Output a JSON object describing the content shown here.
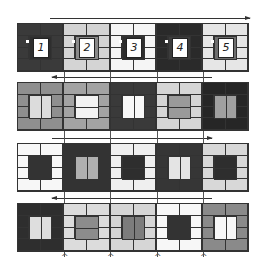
{
  "diagram": {
    "colors": {
      "white": "#ffffff",
      "light": "#d9d9d9",
      "gray": "#9a9a9a",
      "mid": "#7a7a7a",
      "dark": "#3a3a3a",
      "darkest": "#262626",
      "line": "#333333"
    },
    "rows": [
      {
        "direction": "right",
        "tiles": [
          {
            "label": "1",
            "frame": "#3a3a3a",
            "center": "#2e2e2e",
            "split": "none"
          },
          {
            "label": "2",
            "frame": "#d4d4d4",
            "center": "#8a8a8a",
            "split": "none"
          },
          {
            "label": "3",
            "frame": "#f5f5f5",
            "center": "#2e2e2e",
            "split": "none"
          },
          {
            "label": "4",
            "frame": "#2a2a2a",
            "center": "#3c3c3c",
            "split": "none"
          },
          {
            "label": "5",
            "frame": "#e6e6e6",
            "center": "#6e6e6e",
            "split": "none"
          }
        ]
      },
      {
        "direction": "left",
        "tiles": [
          {
            "frame": "#8f8f8f",
            "center": "#dcdcdc",
            "split": "v"
          },
          {
            "frame": "#a3a3a3",
            "center": "#f2f2f2",
            "split": "h"
          },
          {
            "frame": "#3a3a3a",
            "center": "#f7f7f7",
            "split": "v"
          },
          {
            "frame": "#d6d6d6",
            "center": "#9a9a9a",
            "split": "h"
          },
          {
            "frame": "#262626",
            "center": "#a0a0a0",
            "split": "v"
          }
        ]
      },
      {
        "direction": "right",
        "tiles": [
          {
            "frame": "#f7f7f7",
            "center": "#333333",
            "split": "h"
          },
          {
            "frame": "#333333",
            "center": "#b0b0b0",
            "split": "v"
          },
          {
            "frame": "#efefef",
            "center": "#2e2e2e",
            "split": "h"
          },
          {
            "frame": "#363636",
            "center": "#e4e4e4",
            "split": "v"
          },
          {
            "frame": "#d8d8d8",
            "center": "#2e2e2e",
            "split": "h"
          }
        ]
      },
      {
        "direction": "left",
        "tiles": [
          {
            "frame": "#2e2e2e",
            "center": "#dedede",
            "split": "v"
          },
          {
            "frame": "#dcdcdc",
            "center": "#8c8c8c",
            "split": "h"
          },
          {
            "frame": "#d6d6d6",
            "center": "#7c7c7c",
            "split": "v"
          },
          {
            "frame": "#f7f7f7",
            "center": "#333333",
            "split": "h"
          },
          {
            "frame": "#8a8a8a",
            "center": "#f7f7f7",
            "split": "v"
          }
        ]
      }
    ]
  }
}
